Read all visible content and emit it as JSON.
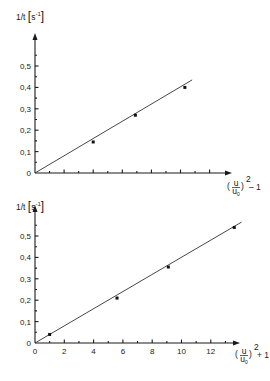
{
  "chart_data": [
    {
      "type": "scatter",
      "title": "",
      "ylabel": "1/t [s^-1]",
      "ylabel_parts": {
        "main": "1/t",
        "unit_open": "[",
        "unit": "s",
        "exp": "-1",
        "unit_close": "]"
      },
      "xlabel": "(u/u0)^2 - 1",
      "xlabel_parts": {
        "num": "u",
        "den": "u0",
        "exp": "2",
        "suffix": "– 1"
      },
      "yticks": [
        "0",
        "0,1",
        "0,2",
        "0,3",
        "0,4",
        "0,5"
      ],
      "ytick_values": [
        0,
        0.1,
        0.2,
        0.3,
        0.4,
        0.5
      ],
      "xticks": [],
      "xlim": [
        0,
        13.5
      ],
      "ylim": [
        0,
        0.58
      ],
      "points": [
        {
          "x": 4.0,
          "y": 0.145
        },
        {
          "x": 6.9,
          "y": 0.27
        },
        {
          "x": 10.3,
          "y": 0.4
        }
      ],
      "fit_line": {
        "x0": 0,
        "y0": 0,
        "x1": 10.8,
        "y1": 0.435
      },
      "grid": false
    },
    {
      "type": "scatter",
      "title": "",
      "ylabel": "1/t [s^-1]",
      "ylabel_parts": {
        "main": "1/t",
        "unit_open": "[",
        "unit": "s",
        "exp": "-1",
        "unit_close": "]"
      },
      "xlabel": "(u/u0)^2 + 1",
      "xlabel_parts": {
        "num": "u",
        "den": "u0",
        "exp": "2",
        "suffix": "+ 1"
      },
      "yticks": [
        "0",
        "0,1",
        "0,2",
        "0,3",
        "0,4",
        "0,5"
      ],
      "ytick_values": [
        0,
        0.1,
        0.2,
        0.3,
        0.4,
        0.5
      ],
      "xticks": [
        "0",
        "2",
        "4",
        "6",
        "8",
        "10",
        "12"
      ],
      "xtick_values": [
        0,
        2,
        4,
        6,
        8,
        10,
        12
      ],
      "xlim": [
        0,
        14
      ],
      "ylim": [
        0,
        0.58
      ],
      "points": [
        {
          "x": 1.0,
          "y": 0.04
        },
        {
          "x": 5.6,
          "y": 0.21
        },
        {
          "x": 9.1,
          "y": 0.355
        },
        {
          "x": 13.6,
          "y": 0.54
        }
      ],
      "fit_line": {
        "x0": 0,
        "y0": 0,
        "x1": 14.1,
        "y1": 0.565
      },
      "grid": false
    }
  ]
}
